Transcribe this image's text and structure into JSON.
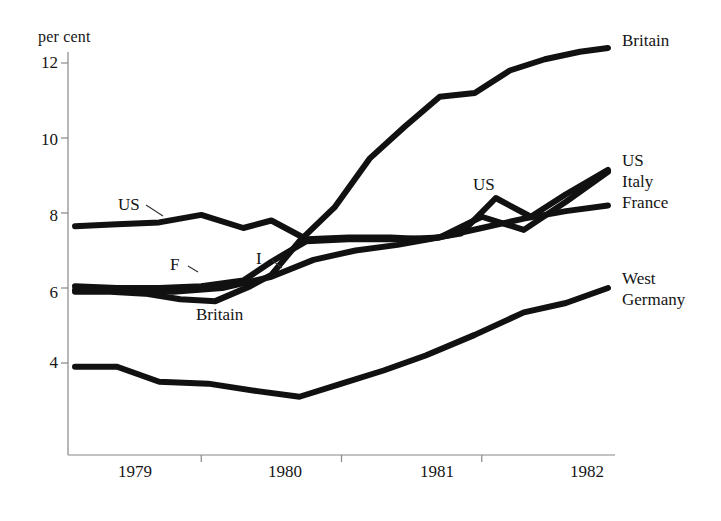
{
  "chart_data": {
    "type": "line",
    "title": "",
    "subtitle": "",
    "xlabel": "",
    "ylabel": "per cent",
    "ylim": [
      2.4,
      13.0
    ],
    "xlim": [
      1978.55,
      1982.45
    ],
    "grid": false,
    "legend_position": "right-inline",
    "y_ticks": [
      4,
      6,
      8,
      10,
      12
    ],
    "x_ticks": [
      "1979",
      "1980",
      "1981",
      "1982"
    ],
    "x_tick_boundaries": [
      1979.5,
      1980.5,
      1981.5
    ],
    "series": [
      {
        "name": "Britain",
        "x": [
          1978.6,
          1978.85,
          1979.1,
          1979.35,
          1979.6,
          1979.85,
          1980.0,
          1980.2,
          1980.45,
          1980.7,
          1980.95,
          1981.2,
          1981.45,
          1981.7,
          1981.95,
          1982.2,
          1982.4
        ],
        "values": [
          5.9,
          5.9,
          5.85,
          5.7,
          5.65,
          6.05,
          6.35,
          7.25,
          8.15,
          9.45,
          10.3,
          11.1,
          11.2,
          11.8,
          12.1,
          12.3,
          12.4
        ]
      },
      {
        "name": "US",
        "x": [
          1978.6,
          1978.9,
          1979.2,
          1979.5,
          1979.8,
          1980.0,
          1980.25,
          1980.55,
          1980.85,
          1981.1,
          1981.35,
          1981.6,
          1981.85,
          1982.1,
          1982.4
        ],
        "values": [
          7.65,
          7.7,
          7.75,
          7.95,
          7.6,
          7.8,
          7.3,
          7.35,
          7.35,
          7.3,
          7.45,
          8.4,
          7.9,
          8.5,
          9.15
        ]
      },
      {
        "name": "Italy",
        "x": [
          1978.6,
          1978.9,
          1979.2,
          1979.5,
          1979.8,
          1980.0,
          1980.25,
          1980.55,
          1980.9,
          1981.2,
          1981.5,
          1981.8,
          1982.1,
          1982.4
        ],
        "values": [
          6.05,
          6.0,
          6.0,
          6.05,
          6.2,
          6.7,
          7.25,
          7.3,
          7.3,
          7.35,
          7.9,
          7.55,
          8.3,
          9.1
        ]
      },
      {
        "name": "France",
        "x": [
          1978.6,
          1978.95,
          1979.3,
          1979.65,
          1980.0,
          1980.3,
          1980.6,
          1980.9,
          1981.2,
          1981.5,
          1981.8,
          1982.1,
          1982.4
        ],
        "values": [
          5.95,
          5.95,
          5.9,
          6.0,
          6.3,
          6.75,
          7.0,
          7.15,
          7.35,
          7.6,
          7.85,
          8.05,
          8.2
        ]
      },
      {
        "name": "West Germany",
        "x": [
          1978.6,
          1978.9,
          1979.2,
          1979.55,
          1979.9,
          1980.2,
          1980.5,
          1980.8,
          1981.1,
          1981.45,
          1981.8,
          1982.1,
          1982.4
        ],
        "values": [
          3.9,
          3.9,
          3.5,
          3.45,
          3.25,
          3.1,
          3.45,
          3.8,
          4.2,
          4.75,
          5.35,
          5.6,
          6.0
        ]
      }
    ],
    "inline_annotations": [
      {
        "text": "US",
        "x": 1979.05,
        "y": 8.3
      },
      {
        "text": "F",
        "x": 1979.55,
        "y": 6.75
      },
      {
        "text": "I",
        "x": 1980.1,
        "y": 6.85
      },
      {
        "text": "Britain",
        "x": 1979.85,
        "y": 5.15
      },
      {
        "text": "US",
        "x": 1981.55,
        "y": 8.6
      }
    ],
    "right_labels": [
      {
        "text": "Britain",
        "y": 12.45
      },
      {
        "text": "US",
        "y": 9.25
      },
      {
        "text": "Italy",
        "y": 8.75
      },
      {
        "text": "France",
        "y": 8.2
      },
      {
        "text": "West",
        "y": 6.3
      },
      {
        "text": "Germany",
        "y": 5.8
      }
    ],
    "style": {
      "line_color": "#111111",
      "axis_color": "#888888",
      "background": "#ffffff",
      "line_width_px": 6
    }
  },
  "labels": {
    "axis_title": "per cent",
    "y_4": "4",
    "y_6": "6",
    "y_8": "8",
    "y_10": "10",
    "y_12": "12",
    "x_1979": "1979",
    "x_1980": "1980",
    "x_1981": "1981",
    "x_1982": "1982",
    "ann_us_left": "US",
    "ann_f": "F",
    "ann_i": "I",
    "ann_britain": "Britain",
    "ann_us_right": "US",
    "leg_britain": "Britain",
    "leg_us": "US",
    "leg_italy": "Italy",
    "leg_france": "France",
    "leg_west": "West",
    "leg_germany": "Germany"
  }
}
